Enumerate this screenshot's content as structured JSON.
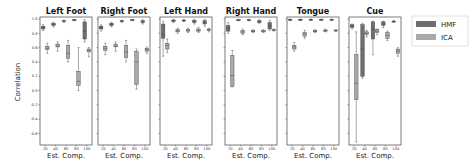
{
  "chart_data": {
    "type": "box",
    "title": "",
    "ylabel": "Correlation",
    "xlabel": "Est. Comp.",
    "ylim": [
      -0.77,
      1.0
    ],
    "yticks": [
      1.0,
      0.8,
      0.6,
      0.4,
      0.2,
      0.0,
      -0.2,
      -0.4,
      -0.6
    ],
    "ytick_labels": [
      "1.0",
      "0.8",
      "0.6",
      "0.4",
      "0.2",
      "0.0",
      "-0.2",
      "-0.4",
      "-0.6"
    ],
    "categories": [
      "20",
      "40",
      "60",
      "80",
      "100"
    ],
    "legend": [
      {
        "name": "HMF",
        "color": "#6e6e6e"
      },
      {
        "name": "ICA",
        "color": "#a9a9a9"
      }
    ],
    "legend_position": "upper right, outside",
    "panels": [
      {
        "title": "Left Foot",
        "series": [
          {
            "name": "HMF",
            "boxes": [
              {
                "q1": 0.86,
                "med": 0.88,
                "q3": 0.9,
                "lo": 0.84,
                "hi": 0.92
              },
              {
                "q1": 0.91,
                "med": 0.925,
                "q3": 0.94,
                "lo": 0.89,
                "hi": 0.955
              },
              {
                "q1": 0.965,
                "med": 0.97,
                "q3": 0.975,
                "lo": 0.955,
                "hi": 0.985
              },
              {
                "q1": 0.98,
                "med": 0.985,
                "q3": 0.99,
                "lo": 0.975,
                "hi": 0.995
              },
              {
                "q1": 0.72,
                "med": 0.83,
                "q3": 0.96,
                "lo": 0.68,
                "hi": 0.99
              }
            ]
          },
          {
            "name": "ICA",
            "boxes": [
              {
                "q1": 0.57,
                "med": 0.59,
                "q3": 0.62,
                "lo": 0.52,
                "hi": 0.66
              },
              {
                "q1": 0.61,
                "med": 0.62,
                "q3": 0.65,
                "lo": 0.55,
                "hi": 0.68
              },
              {
                "q1": 0.45,
                "med": 0.52,
                "q3": 0.63,
                "lo": 0.4,
                "hi": 0.7
              },
              {
                "q1": 0.07,
                "med": 0.13,
                "q3": 0.27,
                "lo": 0.0,
                "hi": 0.6
              },
              {
                "q1": 0.54,
                "med": 0.56,
                "q3": 0.58,
                "lo": 0.47,
                "hi": 0.6
              }
            ]
          }
        ]
      },
      {
        "title": "Right Foot",
        "series": [
          {
            "name": "HMF",
            "boxes": [
              {
                "q1": 0.86,
                "med": 0.88,
                "q3": 0.9,
                "lo": 0.83,
                "hi": 0.92
              },
              {
                "q1": 0.91,
                "med": 0.925,
                "q3": 0.94,
                "lo": 0.89,
                "hi": 0.955
              },
              {
                "q1": 0.965,
                "med": 0.97,
                "q3": 0.975,
                "lo": 0.955,
                "hi": 0.985
              },
              {
                "q1": 0.98,
                "med": 0.985,
                "q3": 0.99,
                "lo": 0.975,
                "hi": 0.995
              },
              {
                "q1": 0.95,
                "med": 0.96,
                "q3": 0.975,
                "lo": 0.93,
                "hi": 0.99
              }
            ]
          },
          {
            "name": "ICA",
            "boxes": [
              {
                "q1": 0.56,
                "med": 0.59,
                "q3": 0.62,
                "lo": 0.5,
                "hi": 0.66
              },
              {
                "q1": 0.61,
                "med": 0.62,
                "q3": 0.65,
                "lo": 0.55,
                "hi": 0.68
              },
              {
                "q1": 0.46,
                "med": 0.54,
                "q3": 0.63,
                "lo": 0.4,
                "hi": 0.7
              },
              {
                "q1": 0.08,
                "med": 0.4,
                "q3": 0.55,
                "lo": 0.02,
                "hi": 0.58
              },
              {
                "q1": 0.55,
                "med": 0.57,
                "q3": 0.59,
                "lo": 0.52,
                "hi": 0.61
              }
            ]
          }
        ]
      },
      {
        "title": "Left Hand",
        "series": [
          {
            "name": "HMF",
            "boxes": [
              {
                "q1": 0.73,
                "med": 0.78,
                "q3": 0.93,
                "lo": 0.48,
                "hi": 0.97
              },
              {
                "q1": 0.965,
                "med": 0.975,
                "q3": 0.985,
                "lo": 0.95,
                "hi": 0.995
              },
              {
                "q1": 0.975,
                "med": 0.98,
                "q3": 0.985,
                "lo": 0.965,
                "hi": 0.995
              },
              {
                "q1": 0.95,
                "med": 0.965,
                "q3": 0.98,
                "lo": 0.93,
                "hi": 0.995
              },
              {
                "q1": 0.93,
                "med": 0.955,
                "q3": 0.975,
                "lo": 0.9,
                "hi": 0.995
              }
            ]
          },
          {
            "name": "ICA",
            "boxes": [
              {
                "q1": 0.58,
                "med": 0.63,
                "q3": 0.66,
                "lo": 0.53,
                "hi": 0.72
              },
              {
                "q1": 0.82,
                "med": 0.835,
                "q3": 0.85,
                "lo": 0.8,
                "hi": 0.87
              },
              {
                "q1": 0.83,
                "med": 0.84,
                "q3": 0.85,
                "lo": 0.81,
                "hi": 0.87
              },
              {
                "q1": 0.83,
                "med": 0.84,
                "q3": 0.86,
                "lo": 0.81,
                "hi": 0.88
              },
              {
                "q1": 0.84,
                "med": 0.85,
                "q3": 0.86,
                "lo": 0.82,
                "hi": 0.87
              }
            ]
          }
        ]
      },
      {
        "title": "Right Hand",
        "series": [
          {
            "name": "HMF",
            "boxes": [
              {
                "q1": 0.83,
                "med": 0.87,
                "q3": 0.91,
                "lo": 0.8,
                "hi": 0.95
              },
              {
                "q1": 0.98,
                "med": 0.985,
                "q3": 0.99,
                "lo": 0.975,
                "hi": 0.995
              },
              {
                "q1": 0.98,
                "med": 0.985,
                "q3": 0.99,
                "lo": 0.975,
                "hi": 0.995
              },
              {
                "q1": 0.95,
                "med": 0.96,
                "q3": 0.975,
                "lo": 0.94,
                "hi": 0.99
              },
              {
                "q1": 0.86,
                "med": 0.9,
                "q3": 0.95,
                "lo": 0.84,
                "hi": 0.98
              }
            ]
          },
          {
            "name": "ICA",
            "boxes": [
              {
                "q1": 0.06,
                "med": 0.21,
                "q3": 0.49,
                "lo": 0.05,
                "hi": 0.56
              },
              {
                "q1": 0.8,
                "med": 0.82,
                "q3": 0.84,
                "lo": 0.78,
                "hi": 0.86
              },
              {
                "q1": 0.82,
                "med": 0.83,
                "q3": 0.84,
                "lo": 0.81,
                "hi": 0.85
              },
              {
                "q1": 0.82,
                "med": 0.83,
                "q3": 0.84,
                "lo": 0.81,
                "hi": 0.85
              },
              {
                "q1": 0.84,
                "med": 0.845,
                "q3": 0.85,
                "lo": 0.83,
                "hi": 0.86
              }
            ]
          }
        ]
      },
      {
        "title": "Tongue",
        "series": [
          {
            "name": "HMF",
            "boxes": [
              {
                "q1": 0.985,
                "med": 0.99,
                "q3": 0.995,
                "lo": 0.98,
                "hi": 1.0
              },
              {
                "q1": 0.985,
                "med": 0.99,
                "q3": 0.995,
                "lo": 0.98,
                "hi": 1.0
              },
              {
                "q1": 0.985,
                "med": 0.99,
                "q3": 0.995,
                "lo": 0.98,
                "hi": 1.0
              },
              {
                "q1": 0.985,
                "med": 0.99,
                "q3": 0.995,
                "lo": 0.98,
                "hi": 1.0
              },
              {
                "q1": 0.985,
                "med": 0.99,
                "q3": 0.995,
                "lo": 0.98,
                "hi": 1.0
              }
            ]
          },
          {
            "name": "ICA",
            "boxes": [
              {
                "q1": 0.58,
                "med": 0.61,
                "q3": 0.63,
                "lo": 0.55,
                "hi": 0.67
              },
              {
                "q1": 0.76,
                "med": 0.79,
                "q3": 0.81,
                "lo": 0.73,
                "hi": 0.84
              },
              {
                "q1": 0.82,
                "med": 0.83,
                "q3": 0.84,
                "lo": 0.81,
                "hi": 0.85
              },
              {
                "q1": 0.83,
                "med": 0.84,
                "q3": 0.845,
                "lo": 0.82,
                "hi": 0.86
              },
              {
                "q1": 0.835,
                "med": 0.84,
                "q3": 0.845,
                "lo": 0.83,
                "hi": 0.85
              }
            ]
          }
        ]
      },
      {
        "title": "Cue",
        "series": [
          {
            "name": "HMF",
            "boxes": [
              {
                "q1": 0.88,
                "med": 0.9,
                "q3": 0.92,
                "lo": 0.86,
                "hi": 0.93
              },
              {
                "q1": 0.2,
                "med": 0.58,
                "q3": 0.92,
                "lo": 0.17,
                "hi": 0.94
              },
              {
                "q1": 0.72,
                "med": 0.86,
                "q3": 0.96,
                "lo": 0.5,
                "hi": 0.97
              },
              {
                "q1": 0.91,
                "med": 0.93,
                "q3": 0.96,
                "lo": 0.88,
                "hi": 0.97
              },
              {
                "q1": 0.96,
                "med": 0.965,
                "q3": 0.97,
                "lo": 0.955,
                "hi": 0.98
              }
            ]
          },
          {
            "name": "ICA",
            "boxes": [
              {
                "q1": -0.13,
                "med": 0.1,
                "q3": 0.5,
                "lo": -0.72,
                "hi": 0.82
              },
              {
                "q1": 0.78,
                "med": 0.8,
                "q3": 0.82,
                "lo": 0.75,
                "hi": 0.84
              },
              {
                "q1": 0.81,
                "med": 0.83,
                "q3": 0.85,
                "lo": 0.78,
                "hi": 0.86
              },
              {
                "q1": 0.73,
                "med": 0.77,
                "q3": 0.81,
                "lo": 0.7,
                "hi": 0.83
              },
              {
                "q1": 0.52,
                "med": 0.55,
                "q3": 0.58,
                "lo": 0.48,
                "hi": 0.6
              }
            ]
          }
        ]
      }
    ]
  },
  "legend": {
    "hmf_label": "HMF",
    "ica_label": "ICA"
  },
  "axes": {
    "ylabel": "Correlation",
    "xlabel": "Est. Comp."
  },
  "colors": {
    "hmf": "#6e6e6e",
    "ica": "#a9a9a9",
    "frame": "#444444",
    "whisker": "#555555"
  }
}
